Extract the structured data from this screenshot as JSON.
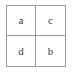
{
  "figure": {
    "type": "2x2-grid",
    "columns": 2,
    "rows": 2,
    "border_color": "#9a9a9a",
    "cell_background": "#ffffff",
    "text_color": "#3d3d3d",
    "page_background": "#ffffff",
    "cells": [
      {
        "row": 0,
        "col": 0,
        "label": "a"
      },
      {
        "row": 0,
        "col": 1,
        "label": "c"
      },
      {
        "row": 1,
        "col": 0,
        "label": "d"
      },
      {
        "row": 1,
        "col": 1,
        "label": "b"
      }
    ]
  }
}
